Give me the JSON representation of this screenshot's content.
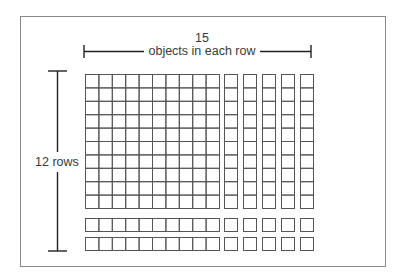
{
  "diagram": {
    "type": "array-model",
    "top_bracket": {
      "count_label": "15",
      "description_label": "objects in each row"
    },
    "side_bracket": {
      "label": "12 rows"
    },
    "grid": {
      "total_rows": 12,
      "total_columns": 15,
      "main_block": {
        "rows": 10,
        "columns": 10
      },
      "right_columns": {
        "count": 5,
        "rows_each": 10
      },
      "bottom_rows": {
        "count": 2,
        "columns_each": 10
      },
      "corner_units": {
        "rows": 2,
        "columns": 5
      },
      "product": 180
    },
    "colors": {
      "line": "#555555",
      "frame": "#8a8a8a",
      "background": "#ffffff"
    }
  }
}
